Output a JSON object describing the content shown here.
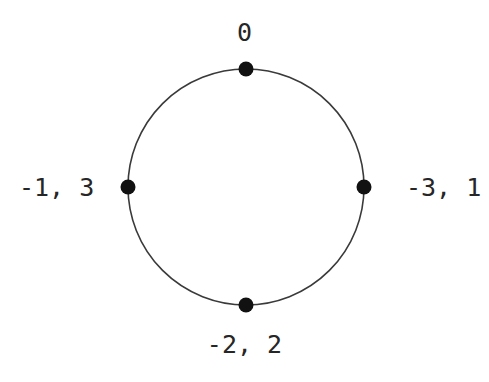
{
  "diagram": {
    "type": "cycle-graph",
    "background_color": "#ffffff",
    "stroke_color": "#3a3a3a",
    "node_color": "#111111",
    "label_color": "#262626",
    "circle": {
      "center_x": 246,
      "center_y": 187,
      "radius": 118,
      "stroke_width": 1.6
    },
    "node_radius": 7.5,
    "nodes": [
      {
        "id": "node-top",
        "label": "0",
        "label_position": "above",
        "angle_deg": 90,
        "cx": 246,
        "cy": 69
      },
      {
        "id": "node-right",
        "label": "-3, 1",
        "label_position": "right",
        "angle_deg": 0,
        "cx": 364,
        "cy": 187
      },
      {
        "id": "node-bottom",
        "label": "-2, 2",
        "label_position": "below",
        "angle_deg": 270,
        "cx": 246,
        "cy": 305
      },
      {
        "id": "node-left",
        "label": "-1, 3",
        "label_position": "left",
        "angle_deg": 180,
        "cx": 128,
        "cy": 187
      }
    ]
  }
}
